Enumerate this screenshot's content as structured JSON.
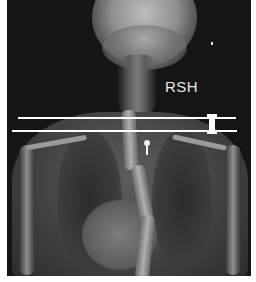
{
  "image": {
    "description": "Frontal chest/spine radiograph showing thoracic scoliosis with shoulder level reference lines",
    "annotation_label": "RSH",
    "reference_lines": 2,
    "colors": {
      "background": "#ffffff",
      "film": "#151515",
      "annotation": "#ffffff"
    }
  }
}
